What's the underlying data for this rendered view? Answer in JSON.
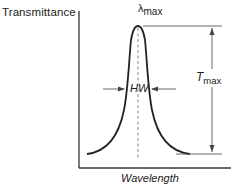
{
  "figure": {
    "y_axis_label": "Transmittance",
    "x_axis_label": "Wavelength",
    "peak_label": {
      "symbol": "λ",
      "subscript": "max"
    },
    "width_label": "HW",
    "height_label": {
      "symbol": "T",
      "subscript": "max"
    },
    "curve_type": "transmission band peak",
    "colors": {
      "line": "#222222",
      "dashed": "#888888",
      "background": "#ffffff"
    }
  }
}
